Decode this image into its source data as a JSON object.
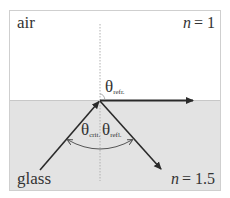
{
  "diagram": {
    "upper_medium": {
      "name": "air",
      "index_label": "n = 1",
      "n_symbol": "n",
      "n_value": "= 1"
    },
    "lower_medium": {
      "name": "glass",
      "index_label": "n = 1.5",
      "n_symbol": "n",
      "n_value": "= 1.5"
    },
    "angles": {
      "refracted": {
        "symbol": "θ",
        "subscript": "refr."
      },
      "critical": {
        "symbol": "θ",
        "subscript": "crit."
      },
      "reflected": {
        "symbol": "θ",
        "subscript": "refl."
      }
    },
    "rays": [
      "incident",
      "refracted",
      "reflected"
    ],
    "colors": {
      "air": "#ffffff",
      "glass": "#e3e3e3",
      "frame": "#cfcfcf",
      "ray": "#2a2a2a",
      "normal": "#b0b0b0",
      "arc": "#555555"
    }
  }
}
